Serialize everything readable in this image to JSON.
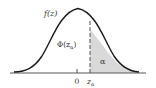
{
  "diagram": {
    "type": "normal-distribution-upper-tail",
    "curve_label": "f(z)",
    "cdf_label": "Φ(z_α)",
    "cdf_label_main": "Φ(z",
    "cdf_label_sub": "α",
    "cdf_label_close": ")",
    "tail_label": "α",
    "axis_ticks": [
      {
        "label": "0"
      },
      {
        "label_main": "z",
        "label_sub": "α"
      }
    ],
    "colors": {
      "curve": "#1a1a1a",
      "shade": "#d9d9d9",
      "axis": "#555555",
      "dashed": "#555555"
    }
  }
}
